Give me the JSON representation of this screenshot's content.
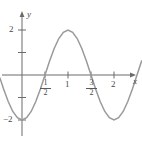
{
  "figure": {
    "kind": "cartesian-graph",
    "width": 142,
    "height": 142,
    "background": "#ffffff",
    "curve_color": "#8a8a8a",
    "axis_color": "#6b6b6b",
    "label_color": "#4a4a4a"
  },
  "axes": {
    "x_axis_label": "x",
    "y_axis_label": "y",
    "x_ticks": [
      {
        "value": 0.5,
        "label_num": "1",
        "label_den": "2",
        "is_fraction": true
      },
      {
        "value": 1,
        "label": "1",
        "is_fraction": false
      },
      {
        "value": 1.5,
        "label_num": "3",
        "label_den": "2",
        "is_fraction": true
      },
      {
        "value": 2,
        "label": "2",
        "is_fraction": false
      }
    ],
    "y_ticks": [
      {
        "value": 2,
        "label": "2"
      },
      {
        "value": 1,
        "label": ""
      },
      {
        "value": -1,
        "label": ""
      },
      {
        "value": -2,
        "label": "−2"
      }
    ],
    "xlim": [
      -0.5,
      2.6
    ],
    "ylim": [
      -2.7,
      2.5
    ],
    "grid": false
  },
  "chart_data": {
    "type": "line",
    "title": "",
    "xlabel": "x",
    "ylabel": "y",
    "xlim": [
      -0.5,
      2.6
    ],
    "ylim": [
      -2.7,
      2.5
    ],
    "grid": false,
    "legend": null,
    "series": [
      {
        "name": "y = -2 cos(pi x)",
        "formula": "-2*cos(PI*x)",
        "x": [
          -0.48,
          -0.4,
          -0.3,
          -0.2,
          -0.1,
          0.0,
          0.1,
          0.2,
          0.3,
          0.4,
          0.5,
          0.6,
          0.7,
          0.8,
          0.9,
          1.0,
          1.1,
          1.2,
          1.3,
          1.4,
          1.5,
          1.6,
          1.7,
          1.8,
          1.9,
          2.0,
          2.1,
          2.2,
          2.3,
          2.4,
          2.5,
          2.6
        ],
        "y": [
          -0.13,
          -0.62,
          -1.18,
          -1.62,
          -1.9,
          -2.0,
          -1.9,
          -1.62,
          -1.18,
          -0.62,
          0.0,
          0.62,
          1.18,
          1.62,
          1.9,
          2.0,
          1.9,
          1.62,
          1.18,
          0.62,
          0.0,
          -0.62,
          -1.18,
          -1.62,
          -1.9,
          -2.0,
          -1.9,
          -1.62,
          -1.18,
          -0.62,
          0.0,
          0.62
        ]
      }
    ],
    "key_points": [
      {
        "x": 0.0,
        "y": -2,
        "note": "minimum"
      },
      {
        "x": 0.5,
        "y": 0,
        "note": "x-intercept"
      },
      {
        "x": 1.0,
        "y": 2,
        "note": "maximum"
      },
      {
        "x": 1.5,
        "y": 0,
        "note": "x-intercept"
      },
      {
        "x": 2.0,
        "y": -2,
        "note": "minimum"
      }
    ]
  }
}
